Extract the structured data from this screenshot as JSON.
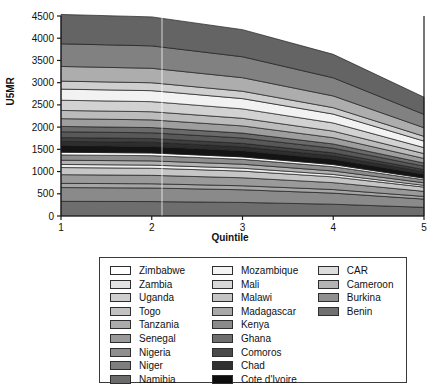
{
  "chart_data": {
    "type": "area",
    "title": "",
    "xlabel": "Quintile",
    "ylabel": "U5MR",
    "x": [
      1,
      2,
      3,
      4,
      5
    ],
    "xticklabels": [
      "1",
      "2",
      "3",
      "4",
      "5"
    ],
    "xlim": [
      1,
      5
    ],
    "ylim": [
      0,
      4500
    ],
    "yticks": [
      0,
      500,
      1000,
      1500,
      2000,
      2500,
      3000,
      3500,
      4000,
      4500
    ],
    "yticklabels": [
      "0",
      "500",
      "1000",
      "1500",
      "2000",
      "2500",
      "3000",
      "3500",
      "4000",
      "4500"
    ],
    "grid": false,
    "stacked": true,
    "legend_position": "below",
    "legend_columns": 3,
    "total_top": [
      4230,
      4210,
      3930,
      3430,
      2510
    ],
    "series": [
      {
        "name": "Namibia",
        "color": "#6e6e6e",
        "values": [
          330,
          325,
          305,
          265,
          195
        ]
      },
      {
        "name": "Niger",
        "color": "#8a8a8a",
        "values": [
          310,
          305,
          285,
          250,
          185
        ]
      },
      {
        "name": "Nigeria",
        "color": "#a6a6a6",
        "values": [
          95,
          95,
          90,
          80,
          60
        ]
      },
      {
        "name": "Senegal",
        "color": "#9a9a9a",
        "values": [
          195,
          190,
          180,
          155,
          115
        ]
      },
      {
        "name": "Tanzania",
        "color": "#c6c6c6",
        "values": [
          160,
          160,
          150,
          130,
          95
        ]
      },
      {
        "name": "Togo",
        "color": "#efefef",
        "values": [
          70,
          70,
          65,
          55,
          40
        ]
      },
      {
        "name": "Uganda",
        "color": "#b2b2b2",
        "values": [
          95,
          95,
          90,
          78,
          57
        ]
      },
      {
        "name": "Zambia",
        "color": "#8e8e8e",
        "values": [
          120,
          118,
          110,
          96,
          70
        ]
      },
      {
        "name": "Zimbabwe",
        "color": "#ffffff",
        "values": [
          60,
          60,
          55,
          48,
          35
        ]
      },
      {
        "name": "Cote d'Ivoire",
        "color": "#141414",
        "values": [
          150,
          148,
          138,
          120,
          88
        ]
      },
      {
        "name": "Chad",
        "color": "#2e2e2e",
        "values": [
          95,
          94,
          88,
          76,
          56
        ]
      },
      {
        "name": "Comoros",
        "color": "#3f3f3f",
        "values": [
          85,
          84,
          79,
          68,
          50
        ]
      },
      {
        "name": "Ghana",
        "color": "#585858",
        "values": [
          130,
          128,
          120,
          104,
          76
        ]
      },
      {
        "name": "Kenya",
        "color": "#6a6a6a",
        "values": [
          120,
          118,
          110,
          96,
          70
        ]
      },
      {
        "name": "Madagascar",
        "color": "#9e9e9e",
        "values": [
          175,
          173,
          162,
          140,
          103
        ]
      },
      {
        "name": "Malawi",
        "color": "#bcbcbc",
        "values": [
          185,
          183,
          171,
          148,
          109
        ]
      },
      {
        "name": "Mali",
        "color": "#d2d2d2",
        "values": [
          230,
          227,
          212,
          184,
          135
        ]
      },
      {
        "name": "Mozambique",
        "color": "#f2f2f2",
        "values": [
          250,
          247,
          231,
          200,
          147
        ]
      },
      {
        "name": "CAR",
        "color": "#cfcfcf",
        "values": [
          180,
          178,
          166,
          144,
          106
        ]
      },
      {
        "name": "Cameroon",
        "color": "#adadad",
        "values": [
          330,
          326,
          305,
          264,
          194
        ]
      },
      {
        "name": "Burkina",
        "color": "#818181",
        "values": [
          510,
          504,
          471,
          408,
          300
        ]
      },
      {
        "name": "Benin",
        "color": "#646464",
        "values": [
          660,
          652,
          610,
          528,
          387
        ]
      }
    ]
  },
  "axes": {
    "ylabel": "U5MR",
    "xlabel": "Quintile"
  },
  "legend": {
    "columns": [
      {
        "items": [
          {
            "label": "Zimbabwe",
            "color": "#ffffff"
          },
          {
            "label": "Zambia",
            "color": "#e2e2e2"
          },
          {
            "label": "Uganda",
            "color": "#cfcfcf"
          },
          {
            "label": "Togo",
            "color": "#c2c2c2"
          },
          {
            "label": "Tanzania",
            "color": "#ababab"
          },
          {
            "label": "Senegal",
            "color": "#9a9a9a"
          },
          {
            "label": "Nigeria",
            "color": "#8e8e8e"
          },
          {
            "label": "Niger",
            "color": "#7e7e7e"
          },
          {
            "label": "Namibia",
            "color": "#6b6b6b"
          }
        ]
      },
      {
        "items": [
          {
            "label": "Mozambique",
            "color": "#f4f4f4"
          },
          {
            "label": "Mali",
            "color": "#d8d8d8"
          },
          {
            "label": "Malawi",
            "color": "#c4c4c4"
          },
          {
            "label": "Madagascar",
            "color": "#a8a8a8"
          },
          {
            "label": "Kenya",
            "color": "#8a8a8a"
          },
          {
            "label": "Ghana",
            "color": "#6e6e6e"
          },
          {
            "label": "Comoros",
            "color": "#4a4a4a"
          },
          {
            "label": "Chad",
            "color": "#303030"
          },
          {
            "label": "Cote d'Ivoire",
            "color": "#0d0d0d"
          }
        ]
      },
      {
        "items": [
          {
            "label": "CAR",
            "color": "#dcdcdc"
          },
          {
            "label": "Cameroon",
            "color": "#b4b4b4"
          },
          {
            "label": "Burkina",
            "color": "#909090"
          },
          {
            "label": "Benin",
            "color": "#707070"
          }
        ]
      }
    ]
  },
  "style": {
    "axis_color": "#1a1a1a",
    "band_edge_color": "#1f1f1f",
    "legend_border_color": "#3a3a3a",
    "background": "#ffffff"
  }
}
